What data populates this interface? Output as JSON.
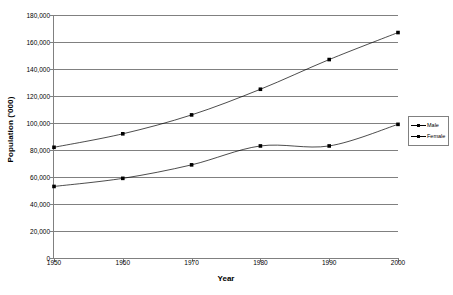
{
  "chart_data": {
    "type": "line",
    "title": "",
    "xlabel": "Year",
    "ylabel": "Population ('000)",
    "x": [
      1950,
      1960,
      1970,
      1980,
      1990,
      2000
    ],
    "xticklabels": [
      "1950",
      "1960",
      "1970",
      "1980",
      "1990",
      "2000"
    ],
    "xlim": [
      1950,
      2000
    ],
    "ylim": [
      0,
      180000
    ],
    "yticks": [
      0,
      20000,
      40000,
      60000,
      80000,
      100000,
      120000,
      140000,
      160000,
      180000
    ],
    "yticklabels": [
      "0",
      "20,000",
      "40,000",
      "60,000",
      "80,000",
      "100,000",
      "120,000",
      "140,000",
      "160,000",
      "180,000"
    ],
    "grid": "horizontal",
    "legend_position": "right",
    "series": [
      {
        "name": "Male",
        "values": [
          82000,
          92000,
          106000,
          125000,
          147000,
          167000
        ],
        "marker": "square",
        "color": "#000000"
      },
      {
        "name": "Female",
        "values": [
          53000,
          59000,
          69000,
          83000,
          83000,
          99000
        ],
        "marker": "square",
        "color": "#000000"
      }
    ]
  },
  "legend": {
    "entries": [
      {
        "label": "Male"
      },
      {
        "label": "Female"
      }
    ]
  },
  "axes": {
    "y_title": "Population ('000)",
    "x_title": "Year"
  },
  "colors": {
    "background": "#ffffff",
    "gridline": "#808080",
    "axis": "#808080",
    "series": "#000000",
    "text": "#000000"
  }
}
